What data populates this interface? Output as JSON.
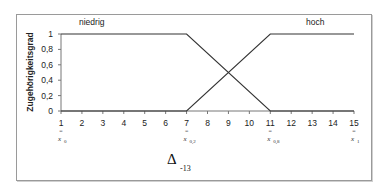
{
  "chart_data": {
    "type": "line",
    "title": "",
    "xlabel": "",
    "ylabel": "Zugehörigkeitsgrad",
    "x": [
      1,
      2,
      3,
      4,
      5,
      6,
      7,
      8,
      9,
      10,
      11,
      12,
      13,
      14,
      15
    ],
    "xticks": [
      "1",
      "2",
      "3",
      "4",
      "5",
      "6",
      "7",
      "8",
      "9",
      "10",
      "11",
      "12",
      "13",
      "14",
      "15"
    ],
    "yticks": [
      "0",
      "0,2",
      "0,4",
      "0,6",
      "0,8",
      "1"
    ],
    "xlim": [
      1,
      15
    ],
    "ylim": [
      0,
      1
    ],
    "grid": false,
    "legend_position": "inline labels above curves",
    "series": [
      {
        "name": "niedrig",
        "points": [
          [
            1,
            1
          ],
          [
            7,
            1
          ],
          [
            11,
            0
          ],
          [
            15,
            0
          ]
        ],
        "values": [
          1,
          1,
          1,
          1,
          1,
          1,
          1,
          0.75,
          0.5,
          0.25,
          0,
          0,
          0,
          0,
          0
        ]
      },
      {
        "name": "hoch",
        "points": [
          [
            1,
            0
          ],
          [
            7,
            0
          ],
          [
            11,
            1
          ],
          [
            15,
            1
          ]
        ],
        "values": [
          0,
          0,
          0,
          0,
          0,
          0,
          0,
          0.25,
          0.5,
          0.75,
          1,
          1,
          1,
          1,
          1
        ]
      }
    ],
    "annotations": [
      {
        "x": 1,
        "text": "x",
        "sub": "0"
      },
      {
        "x": 7,
        "text": "x",
        "sub": "0,2"
      },
      {
        "x": 11,
        "text": "x",
        "sub": "0,8"
      },
      {
        "x": 15,
        "text": "x",
        "sub": "1"
      }
    ],
    "footer_label": {
      "symbol": "Δ",
      "sub": "-13"
    }
  },
  "labels": {
    "series_low": "niedrig",
    "series_high": "hoch",
    "ylabel": "Zugehörigkeitsgrad",
    "eq_mark": "=",
    "annot_x": "x",
    "annot_sub_0": "0",
    "annot_sub_1": "0,2",
    "annot_sub_2": "0,8",
    "annot_sub_3": "1",
    "delta": "Δ",
    "delta_sub": "-13"
  }
}
